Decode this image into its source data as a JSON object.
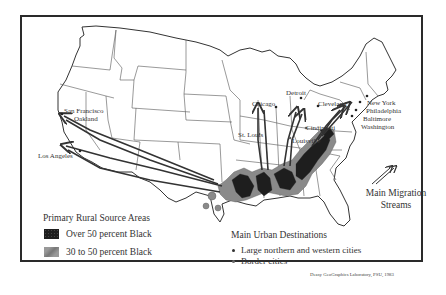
{
  "map": {
    "subject": "Black rural-to-urban migration, United States",
    "colors": {
      "frame": "#2a2a2a",
      "state_lines": "#444444",
      "over_50": "#1e1e1e",
      "thirty_to_50": "#8a8a8a",
      "arrows": "#333333"
    },
    "cities": {
      "san_francisco": "San Francisco",
      "oakland": "Oakland",
      "los_angeles": "Los Angeles",
      "chicago": "Chicago",
      "detroit": "Detroit",
      "cleveland": "Cleveland",
      "st_louis": "St. Louis",
      "cincinnati": "Cincinnati",
      "louisville": "Louisville",
      "new_york": "New York",
      "philadelphia": "Philadelphia",
      "baltimore": "Baltimore",
      "washington": "Washington"
    }
  },
  "legend": {
    "source_title": "Primary Rural Source Areas",
    "source_items": [
      {
        "label": "Over 50 percent Black",
        "swatch": "dark"
      },
      {
        "label": "30 to 50 percent Black",
        "swatch": "mid"
      }
    ],
    "destinations_title": "Main Urban Destinations",
    "destination_items": [
      {
        "label": "Large northern and western cities",
        "marker": "filled-dot"
      },
      {
        "label": "Border cities",
        "marker": "open-dot"
      }
    ],
    "streams_label_line1": "Main Migration",
    "streams_label_line2": "Streams"
  },
  "credit": "Deasy GeoGraphics Laboratory, PSU, 1983"
}
